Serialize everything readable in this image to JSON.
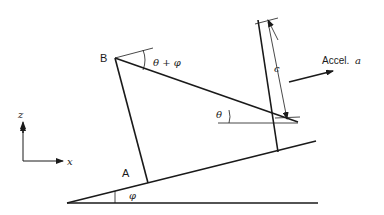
{
  "diagram": {
    "labels": {
      "point_b": "B",
      "point_a": "A",
      "angle_top": "θ + φ",
      "angle_theta": "θ",
      "angle_phi": "φ",
      "dimension_c": "c",
      "accel_prefix": "Accel.",
      "accel_symbol": "a",
      "axis_z": "z",
      "axis_x": "x"
    },
    "colors": {
      "stroke": "#1a1a1a",
      "background": "#ffffff"
    }
  }
}
